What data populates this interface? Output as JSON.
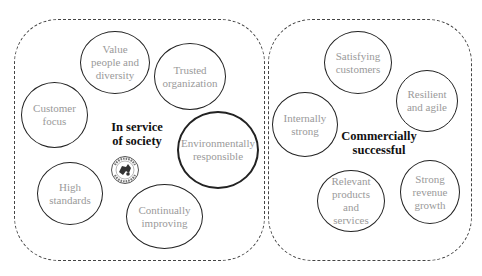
{
  "groups": [
    {
      "id": "society",
      "label": "In service\nof society",
      "items": [
        {
          "label": "Value\npeople and\ndiversity"
        },
        {
          "label": "Trusted\norganization"
        },
        {
          "label": "Customer\nfocus"
        },
        {
          "label": "Environmentally\nresponsible"
        },
        {
          "label": "High\nstandards"
        },
        {
          "label": "Continually\nimproving"
        }
      ]
    },
    {
      "id": "commercial",
      "label": "Commercially\nsuccessful",
      "items": [
        {
          "label": "Satisfying\ncustomers"
        },
        {
          "label": "Resilient\nand agile"
        },
        {
          "label": "Internally\nstrong"
        },
        {
          "label": "Relevant\nproducts\nand\nservices"
        },
        {
          "label": "Strong\nrevenue\ngrowth"
        }
      ]
    }
  ],
  "icons": {
    "stamp": "circular-seal-badge-icon"
  },
  "colors": {
    "circle_border": "#222222",
    "circle_text": "#9a9a9a",
    "group_border": "#444444",
    "center_text": "#111111"
  }
}
